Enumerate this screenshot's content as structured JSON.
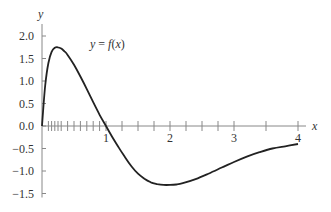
{
  "chart_data": {
    "type": "line",
    "title": "",
    "xlabel": "x",
    "ylabel": "y",
    "xlim": [
      0,
      4
    ],
    "ylim": [
      -1.5,
      2.0
    ],
    "grid": false,
    "legend": null,
    "annotations": [
      {
        "text": "y = f(x)",
        "x": 1.0,
        "y": 1.6
      }
    ],
    "x_tick_labels": [
      "1",
      "2",
      "3",
      "4"
    ],
    "x_major_ticks": [
      1,
      2,
      3,
      4
    ],
    "x_minor_ticks": [
      0.1,
      0.15,
      0.2,
      0.25,
      0.3,
      0.4,
      0.5,
      0.6,
      0.7,
      0.8,
      0.9,
      1.25,
      1.5,
      1.75,
      2.25,
      2.5,
      2.75,
      3.5
    ],
    "y_tick_labels": [
      "2.0",
      "1.5",
      "1.0",
      "0.5",
      "0.0",
      "−0.5",
      "−1.0",
      "−1.5"
    ],
    "y_ticks": [
      2.0,
      1.5,
      1.0,
      0.5,
      0.0,
      -0.5,
      -1.0,
      -1.5
    ],
    "series": [
      {
        "name": "y = f(x)",
        "x": [
          0.0,
          0.05,
          0.1,
          0.15,
          0.2,
          0.25,
          0.3,
          0.35,
          0.4,
          0.5,
          0.6,
          0.7,
          0.8,
          0.9,
          1.0,
          1.1,
          1.2,
          1.3,
          1.4,
          1.5,
          1.6,
          1.7,
          1.8,
          1.9,
          2.0,
          2.1,
          2.2,
          2.4,
          2.6,
          2.8,
          3.0,
          3.2,
          3.4,
          3.6,
          3.8,
          4.0
        ],
        "y": [
          0.0,
          0.9,
          1.4,
          1.65,
          1.74,
          1.75,
          1.72,
          1.66,
          1.58,
          1.36,
          1.1,
          0.82,
          0.53,
          0.25,
          0.0,
          -0.25,
          -0.48,
          -0.7,
          -0.9,
          -1.06,
          -1.17,
          -1.25,
          -1.29,
          -1.31,
          -1.31,
          -1.3,
          -1.27,
          -1.18,
          -1.06,
          -0.93,
          -0.8,
          -0.68,
          -0.58,
          -0.5,
          -0.45,
          -0.4
        ]
      }
    ],
    "colors": {
      "curve": "#222222",
      "axis": "#888888",
      "text": "#333333"
    }
  },
  "plot": {
    "origin_px": [
      42,
      126
    ],
    "x_scale_px_per_unit": 64,
    "y_scale_px_per_unit": 45
  }
}
